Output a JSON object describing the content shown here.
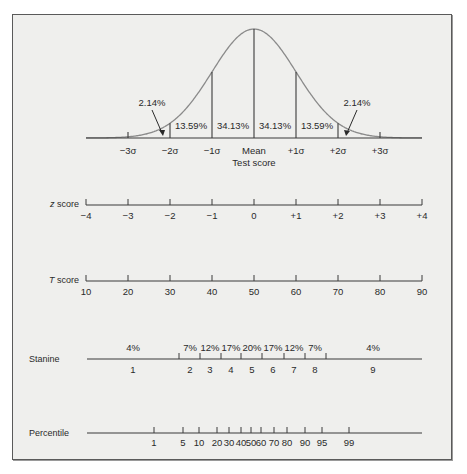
{
  "chart_data": {
    "type": "diagram",
    "curve": {
      "sigma_labels": [
        "−3σ",
        "−2σ",
        "−1σ",
        "Mean",
        "+1σ",
        "+2σ",
        "+3σ"
      ],
      "xlabel": "Test score",
      "area_labels": [
        {
          "label": "2.14%",
          "region": "-3σ to -2σ"
        },
        {
          "label": "13.59%",
          "region": "-2σ to -1σ"
        },
        {
          "label": "34.13%",
          "region": "-1σ to mean"
        },
        {
          "label": "34.13%",
          "region": "mean to +1σ"
        },
        {
          "label": "13.59%",
          "region": "+1σ to +2σ"
        },
        {
          "label": "2.14%",
          "region": "+2σ to +3σ"
        }
      ]
    },
    "scales": {
      "z_score": {
        "label_prefix": "z",
        "label_suffix": " score",
        "ticks": [
          "−4",
          "−3",
          "−2",
          "−1",
          "0",
          "+1",
          "+2",
          "+3",
          "+4"
        ]
      },
      "t_score": {
        "label_prefix": "T",
        "label_suffix": " score",
        "ticks": [
          "10",
          "20",
          "30",
          "40",
          "50",
          "60",
          "70",
          "80",
          "90"
        ]
      },
      "stanine": {
        "label": "Stanine",
        "values": [
          "1",
          "2",
          "3",
          "4",
          "5",
          "6",
          "7",
          "8",
          "9"
        ],
        "percents": [
          "4%",
          "7%",
          "12%",
          "17%",
          "20%",
          "17%",
          "12%",
          "7%",
          "4%"
        ]
      },
      "percentile": {
        "label": "Percentile",
        "ticks": [
          "1",
          "5",
          "10",
          "20",
          "30",
          "40",
          "50",
          "60",
          "70",
          "80",
          "90",
          "95",
          "99"
        ]
      }
    },
    "colors": {
      "background": "#efefed",
      "curve": "#8a8a8a",
      "lines": "#3a3a3a",
      "text": "#2a2a2a"
    }
  }
}
